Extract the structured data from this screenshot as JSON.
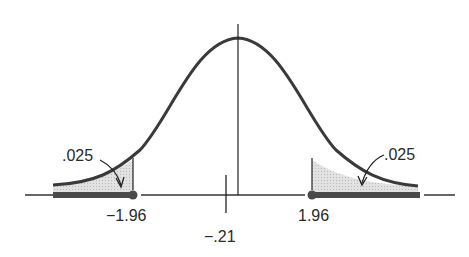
{
  "diagram": {
    "type": "normal-distribution-two-tailed-test",
    "curve_color": "#3a3a3a",
    "shade_color": "#d6d6d6",
    "rejection_bar_color": "#4a4a4a",
    "labels": {
      "left_tail_area": ".025",
      "right_tail_area": ".025",
      "left_critical": "−1.96",
      "right_critical": "1.96",
      "observed": "−.21"
    }
  }
}
